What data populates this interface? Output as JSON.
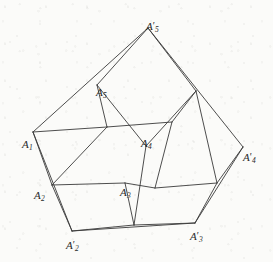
{
  "figure": {
    "stroke_color": "#3a3a3a",
    "background_color": "#fbfbf9",
    "stroke_width": 0.9,
    "width": 273,
    "height": 262,
    "labels": [
      {
        "id": "A1",
        "base": "A",
        "sub": "1",
        "prime": "",
        "text": "A₁",
        "x": 22,
        "y": 139
      },
      {
        "id": "A2",
        "base": "A",
        "sub": "2",
        "prime": "",
        "text": "A₂",
        "x": 34,
        "y": 190
      },
      {
        "id": "A3",
        "base": "A",
        "sub": "3",
        "prime": "",
        "text": "A₃",
        "x": 120,
        "y": 187
      },
      {
        "id": "A4",
        "base": "A",
        "sub": "4",
        "prime": "",
        "text": "A₄",
        "x": 141,
        "y": 138
      },
      {
        "id": "A5",
        "base": "A",
        "sub": "5",
        "prime": "",
        "text": "A₅",
        "x": 96,
        "y": 87
      },
      {
        "id": "A2p",
        "base": "A",
        "sub": "2",
        "prime": "′",
        "text": "A′₂",
        "x": 66,
        "y": 240
      },
      {
        "id": "A3p",
        "base": "A",
        "sub": "3",
        "prime": "′",
        "text": "A′₃",
        "x": 190,
        "y": 231
      },
      {
        "id": "A4p",
        "base": "A",
        "sub": "4",
        "prime": "′",
        "text": "A′₄",
        "x": 243,
        "y": 152
      },
      {
        "id": "A5p",
        "base": "A",
        "sub": "5",
        "prime": "′",
        "text": "A′₅",
        "x": 146,
        "y": 21
      }
    ],
    "points": {
      "A1": [
        33,
        132
      ],
      "A2": [
        52,
        185
      ],
      "A3": [
        125,
        183
      ],
      "A4": [
        146,
        146
      ],
      "A5": [
        97,
        85
      ],
      "A1p": [
        107,
        127
      ],
      "A2p": [
        72,
        231
      ],
      "A3p": [
        195,
        223
      ],
      "A4p": [
        243,
        147
      ],
      "A5p": [
        148,
        28
      ],
      "B1": [
        172,
        122
      ],
      "B2": [
        155,
        188
      ],
      "B3": [
        134,
        225
      ],
      "B4": [
        196,
        91
      ],
      "B5": [
        217,
        183
      ]
    },
    "edges": [
      {
        "name": "outer-A5p-to-A1",
        "from": "A5p",
        "to": "A1"
      },
      {
        "name": "outer-A1-to-A2p",
        "from": "A1",
        "to": "A2p"
      },
      {
        "name": "outer-A2p-to-A3p",
        "from": "A2p",
        "to": "A3p"
      },
      {
        "name": "outer-A3p-to-A4p",
        "from": "A3p",
        "to": "A4p"
      },
      {
        "name": "outer-A4p-to-A5p",
        "from": "A4p",
        "to": "A5p"
      },
      {
        "name": "inner-A1p-to-A2",
        "from": "A1p",
        "to": "A2"
      },
      {
        "name": "inner-A2-to-A3",
        "from": "A2",
        "to": "A3"
      },
      {
        "name": "inner-A3-to-B2",
        "from": "A3",
        "to": "B2"
      },
      {
        "name": "inner-B2-to-B1",
        "from": "B2",
        "to": "B1"
      },
      {
        "name": "inner-B1-to-A1p",
        "from": "B1",
        "to": "A1p"
      },
      {
        "name": "spoke-A5-to-A1p",
        "from": "A5",
        "to": "A1p"
      },
      {
        "name": "spoke-A5-to-A4",
        "from": "A5",
        "to": "A4"
      },
      {
        "name": "spoke-A5p-to-A5",
        "from": "A5p",
        "to": "A5"
      },
      {
        "name": "spoke-A5p-to-B4",
        "from": "A5p",
        "to": "B4"
      },
      {
        "name": "spoke-B4-to-B1",
        "from": "B4",
        "to": "B1"
      },
      {
        "name": "spoke-B4-to-A4",
        "from": "B4",
        "to": "A4"
      },
      {
        "name": "spoke-A4-to-B3",
        "from": "A4",
        "to": "B3"
      },
      {
        "name": "spoke-A3-to-B3",
        "from": "A3",
        "to": "B3"
      },
      {
        "name": "spoke-B3-to-A2p",
        "from": "B3",
        "to": "A2p"
      },
      {
        "name": "spoke-B3-to-A3p",
        "from": "B3",
        "to": "A3p"
      },
      {
        "name": "spoke-B2-to-B5",
        "from": "B2",
        "to": "B5"
      },
      {
        "name": "spoke-B5-to-A3p",
        "from": "B5",
        "to": "A3p"
      },
      {
        "name": "spoke-B5-to-A4p",
        "from": "B5",
        "to": "A4p"
      },
      {
        "name": "spoke-B5-to-B4",
        "from": "B5",
        "to": "B4"
      },
      {
        "name": "spoke-A1-to-A2",
        "from": "A1",
        "to": "A2"
      },
      {
        "name": "spoke-A2-to-A2p",
        "from": "A2",
        "to": "A2p"
      },
      {
        "name": "spoke-A1-to-A1p",
        "from": "A1",
        "to": "A1p"
      }
    ]
  }
}
